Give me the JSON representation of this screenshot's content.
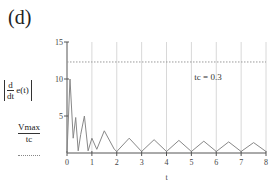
{
  "panel_label": "(d)",
  "annotation": "tc = 0.3",
  "legend": {
    "series1": {
      "d": "d",
      "dt": "dt",
      "expr": "e(t)"
    },
    "series2": {
      "num": "Vmax",
      "den": "tc"
    }
  },
  "chart_data": {
    "type": "line",
    "title": "",
    "xlabel": "t",
    "ylabel": "|d/dt e(t)| , Vmax/tc",
    "xlim": [
      0,
      8
    ],
    "ylim": [
      0,
      15
    ],
    "x_ticks": [
      "0",
      "1",
      "2",
      "3",
      "4",
      "5",
      "6",
      "7",
      "8"
    ],
    "y_ticks": [
      "5",
      "10",
      "15"
    ],
    "grid": "vertical",
    "annotations": [
      "tc = 0.3"
    ],
    "series": [
      {
        "name": "|d/dt e(t)|",
        "style": "solid",
        "x": [
          0,
          0.12,
          0.25,
          0.35,
          0.45,
          0.55,
          0.7,
          0.85,
          1.0,
          1.2,
          1.5,
          1.9,
          2.0,
          2.5,
          3.0,
          3.5,
          4.0,
          4.5,
          5.0,
          5.5,
          6.0,
          6.5,
          7.0,
          7.5,
          8.0
        ],
        "y": [
          0,
          10,
          2,
          4.8,
          0.3,
          2.5,
          5,
          0.3,
          2,
          0.5,
          3,
          0.5,
          0.2,
          2,
          0.2,
          1.8,
          0.2,
          1.7,
          0.2,
          1.6,
          0.2,
          1.5,
          0.2,
          1.4,
          0.2
        ]
      },
      {
        "name": "Vmax/tc",
        "style": "dotted",
        "x": [
          0,
          8
        ],
        "y": [
          12.3,
          12.3
        ]
      }
    ]
  }
}
